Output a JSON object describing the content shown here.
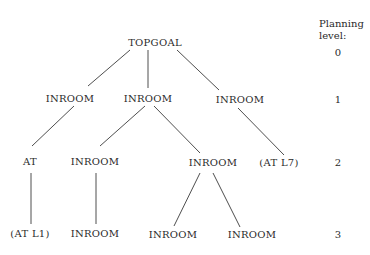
{
  "legend": {
    "title_line1": "Planning",
    "title_line2": "level:",
    "levels": [
      "0",
      "1",
      "2",
      "3"
    ]
  },
  "nodes": {
    "root": "TOPGOAL",
    "l1_a": "INROOM",
    "l1_b": "INROOM",
    "l1_c": "INROOM",
    "l2_a": "AT",
    "l2_b": "INROOM",
    "l2_c": "INROOM",
    "l2_d": "(AT L7)",
    "l3_a": "(AT L1)",
    "l3_b": "INROOM",
    "l3_c": "INROOM",
    "l3_d": "INROOM"
  }
}
